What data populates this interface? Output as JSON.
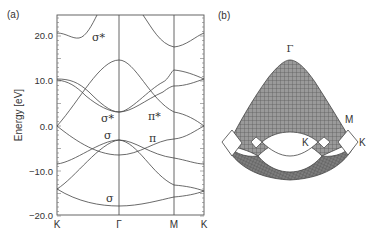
{
  "panels": {
    "a": {
      "label": "(a)"
    },
    "b": {
      "label": "(b)"
    }
  },
  "chart_data": [
    {
      "type": "line",
      "panel": "(a)",
      "title": "",
      "xlabel": "",
      "ylabel": "Energy [eV]",
      "ylim": [
        -20.0,
        24.4
      ],
      "yticks": [
        "20.0",
        "10.0",
        "0.0",
        "−10.0",
        "−20.0"
      ],
      "ytick_values": [
        20,
        10,
        0,
        -10,
        -20
      ],
      "xticks": [
        "K",
        "Γ",
        "M",
        "K"
      ],
      "grid": false,
      "vertical_lines_at": [
        "Γ",
        "M"
      ],
      "annotations": [
        {
          "text": "σ*",
          "near": "upper band between K and Γ, ~20 eV"
        },
        {
          "text": "σ*",
          "near": "Γ, ~2 eV"
        },
        {
          "text": "π*",
          "near": "between Γ and M, ~2 eV"
        },
        {
          "text": "σ",
          "near": "Γ, ~-3 eV"
        },
        {
          "text": "π",
          "near": "between Γ and M, ~-4 eV"
        },
        {
          "text": "σ",
          "near": "Γ, ~-16 eV"
        }
      ],
      "series": [
        {
          "name": "sigma* upper (K-Γ)",
          "x": [
            "K",
            "mid",
            "Γ"
          ],
          "values": [
            20.5,
            19.5,
            26
          ]
        },
        {
          "name": "sigma* upper (Γ-M-K)",
          "x": [
            "Γ",
            "M",
            "K"
          ],
          "values": [
            26,
            17.5,
            20.5
          ]
        },
        {
          "name": "band A",
          "x": [
            "K",
            "Γ",
            "M",
            "K"
          ],
          "values": [
            10.5,
            3.0,
            12.0,
            10.5
          ]
        },
        {
          "name": "band B",
          "x": [
            "K",
            "Γ",
            "M",
            "K"
          ],
          "values": [
            10.5,
            3.0,
            9.0,
            10.5
          ]
        },
        {
          "name": "band C (σ*)",
          "x": [
            "K",
            "Γ",
            "M",
            "K"
          ],
          "values": [
            0.0,
            14.5,
            3.0,
            0.0
          ]
        },
        {
          "name": "pi band",
          "x": [
            "K",
            "Γ",
            "M",
            "K"
          ],
          "values": [
            0.0,
            -6.5,
            -3.0,
            0.0
          ]
        },
        {
          "name": "band D",
          "x": [
            "K",
            "Γ",
            "M",
            "K"
          ],
          "values": [
            -8.5,
            -3.0,
            -7.0,
            -8.5
          ]
        },
        {
          "name": "band E",
          "x": [
            "K",
            "Γ",
            "M",
            "K"
          ],
          "values": [
            -14.0,
            -3.0,
            -13.0,
            -14.5
          ]
        },
        {
          "name": "sigma bottom",
          "x": [
            "K",
            "Γ",
            "M",
            "K"
          ],
          "values": [
            -14.0,
            -17.8,
            -15.8,
            -14.5
          ]
        }
      ]
    },
    {
      "type": "surface",
      "panel": "(b)",
      "title": "",
      "annotations": [
        "Γ",
        "M",
        "K",
        "K"
      ],
      "description": "3D wireframe surface of band dispersion over Brillouin zone, peak at Γ, saddle points at M, cones touching at K"
    }
  ]
}
